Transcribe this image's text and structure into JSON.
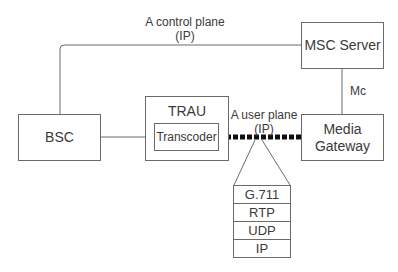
{
  "diagram": {
    "nodes": {
      "bsc": "BSC",
      "trau": "TRAU",
      "transcoder": "Transcoder",
      "msc_server": "MSC Server",
      "media_gateway": "Media Gateway"
    },
    "links": {
      "control_plane": {
        "line1": "A control plane",
        "line2": "(IP)"
      },
      "user_plane": {
        "line1": "A user plane",
        "line2": "(IP)"
      },
      "mc": "Mc"
    },
    "protocol_stack": [
      "G.711",
      "RTP",
      "UDP",
      "IP"
    ],
    "colors": {
      "line": "#6a6a6a",
      "dashed_link": "#111111",
      "text": "#3a3a3a"
    }
  }
}
